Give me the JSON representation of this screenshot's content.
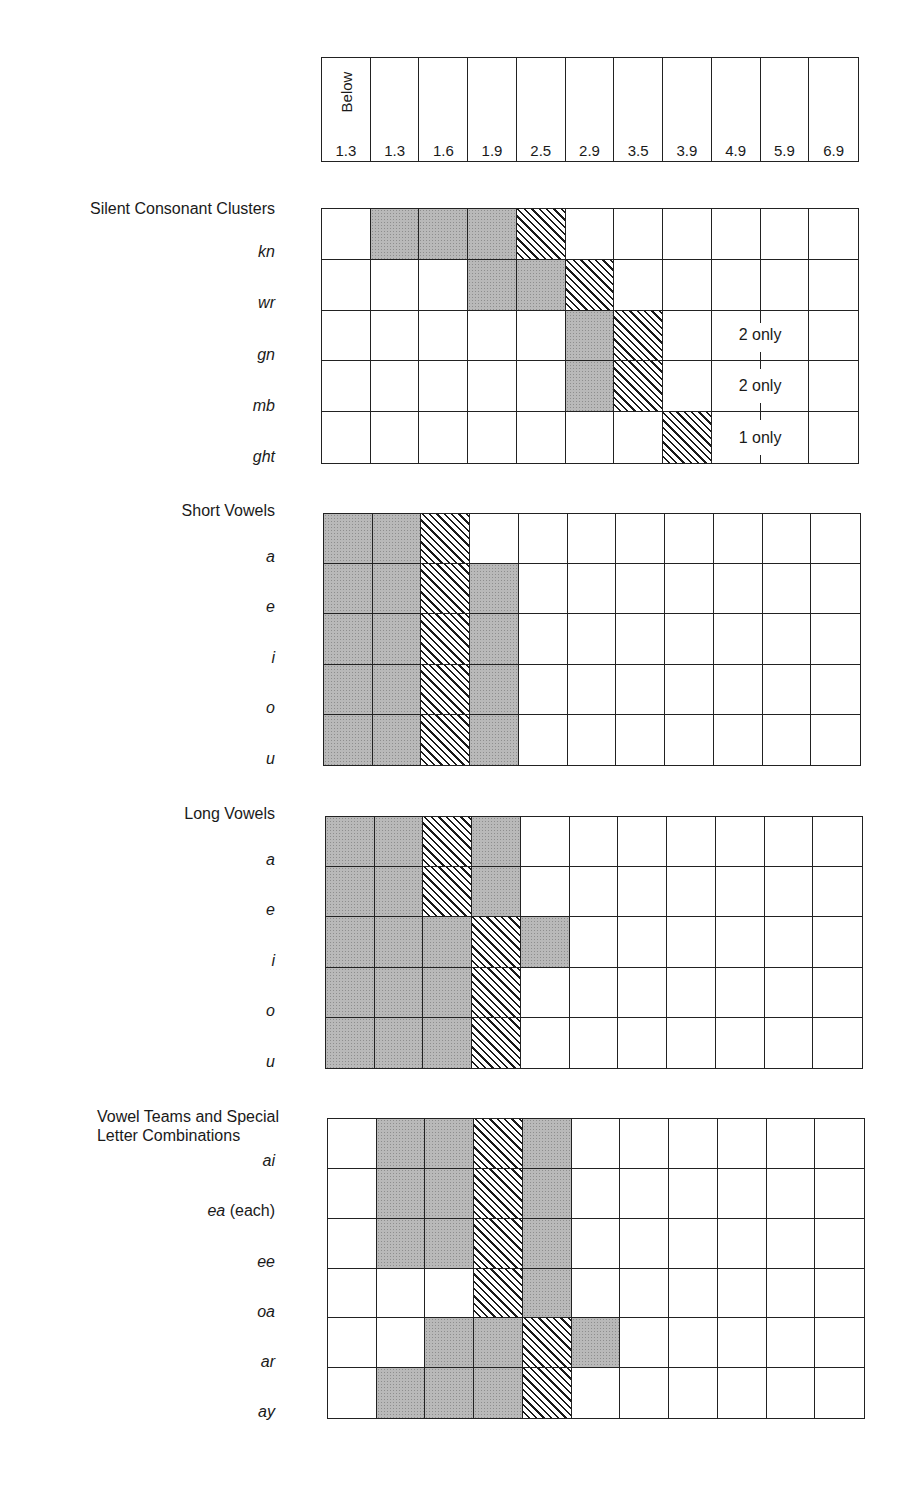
{
  "header": {
    "columns": [
      "1.3",
      "1.3",
      "1.6",
      "1.9",
      "2.5",
      "2.9",
      "3.5",
      "3.9",
      "4.9",
      "5.9",
      "6.9"
    ],
    "first_column_prefix": "Below"
  },
  "legend_semantics": {
    "W": "blank",
    "G": "gray shaded",
    "H": "diagonal hatched"
  },
  "sections": [
    {
      "title": "Silent Consonant Clusters",
      "rows": [
        {
          "label": "kn",
          "cells": [
            "W",
            "G",
            "G",
            "G",
            "H",
            "W",
            "W",
            "W",
            "W",
            "W",
            "W"
          ]
        },
        {
          "label": "wr",
          "cells": [
            "W",
            "W",
            "W",
            "G",
            "G",
            "H",
            "W",
            "W",
            "W",
            "W",
            "W"
          ]
        },
        {
          "label": "gn",
          "cells": [
            "W",
            "W",
            "W",
            "W",
            "W",
            "G",
            "H",
            "W",
            "W",
            "W",
            "W"
          ],
          "note": "2 only"
        },
        {
          "label": "mb",
          "cells": [
            "W",
            "W",
            "W",
            "W",
            "W",
            "G",
            "H",
            "W",
            "W",
            "W",
            "W"
          ],
          "note": "2 only"
        },
        {
          "label": "ght",
          "cells": [
            "W",
            "W",
            "W",
            "W",
            "W",
            "W",
            "W",
            "H",
            "W",
            "W",
            "W"
          ],
          "note": "1 only"
        }
      ]
    },
    {
      "title": "Short Vowels",
      "rows": [
        {
          "label": "a",
          "cells": [
            "G",
            "G",
            "H",
            "W",
            "W",
            "W",
            "W",
            "W",
            "W",
            "W",
            "W"
          ]
        },
        {
          "label": "e",
          "cells": [
            "G",
            "G",
            "H",
            "G",
            "W",
            "W",
            "W",
            "W",
            "W",
            "W",
            "W"
          ]
        },
        {
          "label": "i",
          "cells": [
            "G",
            "G",
            "H",
            "G",
            "W",
            "W",
            "W",
            "W",
            "W",
            "W",
            "W"
          ]
        },
        {
          "label": "o",
          "cells": [
            "G",
            "G",
            "H",
            "G",
            "W",
            "W",
            "W",
            "W",
            "W",
            "W",
            "W"
          ]
        },
        {
          "label": "u",
          "cells": [
            "G",
            "G",
            "H",
            "G",
            "W",
            "W",
            "W",
            "W",
            "W",
            "W",
            "W"
          ]
        }
      ]
    },
    {
      "title": "Long Vowels",
      "rows": [
        {
          "label": "a",
          "cells": [
            "G",
            "G",
            "H",
            "G",
            "W",
            "W",
            "W",
            "W",
            "W",
            "W",
            "W"
          ]
        },
        {
          "label": "e",
          "cells": [
            "G",
            "G",
            "H",
            "G",
            "W",
            "W",
            "W",
            "W",
            "W",
            "W",
            "W"
          ]
        },
        {
          "label": "i",
          "cells": [
            "G",
            "G",
            "G",
            "H",
            "G",
            "W",
            "W",
            "W",
            "W",
            "W",
            "W"
          ]
        },
        {
          "label": "o",
          "cells": [
            "G",
            "G",
            "G",
            "H",
            "W",
            "W",
            "W",
            "W",
            "W",
            "W",
            "W"
          ]
        },
        {
          "label": "u",
          "cells": [
            "G",
            "G",
            "G",
            "H",
            "W",
            "W",
            "W",
            "W",
            "W",
            "W",
            "W"
          ]
        }
      ]
    },
    {
      "title_line1": "Vowel Teams and Special",
      "title_line2": "Letter Combinations",
      "rows": [
        {
          "label": "ai",
          "cells": [
            "W",
            "G",
            "G",
            "H",
            "G",
            "W",
            "W",
            "W",
            "W",
            "W",
            "W"
          ]
        },
        {
          "label": "ea",
          "label_suffix": " (each)",
          "cells": [
            "W",
            "G",
            "G",
            "H",
            "G",
            "W",
            "W",
            "W",
            "W",
            "W",
            "W"
          ]
        },
        {
          "label": "ee",
          "cells": [
            "W",
            "G",
            "G",
            "H",
            "G",
            "W",
            "W",
            "W",
            "W",
            "W",
            "W"
          ]
        },
        {
          "label": "oa",
          "cells": [
            "W",
            "W",
            "W",
            "H",
            "G",
            "W",
            "W",
            "W",
            "W",
            "W",
            "W"
          ]
        },
        {
          "label": "ar",
          "cells": [
            "W",
            "W",
            "G",
            "G",
            "H",
            "G",
            "W",
            "W",
            "W",
            "W",
            "W"
          ]
        },
        {
          "label": "ay",
          "cells": [
            "W",
            "G",
            "G",
            "G",
            "H",
            "W",
            "W",
            "W",
            "W",
            "W",
            "W"
          ]
        }
      ]
    }
  ]
}
